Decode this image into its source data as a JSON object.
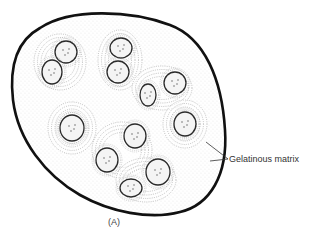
{
  "figure": {
    "caption": "(A)",
    "labels": [
      {
        "text": "Gelatinous matrix",
        "x": 229,
        "y": 156
      }
    ],
    "colony": {
      "outline_path": "M 40 28 C 70 8, 130 10, 170 25 C 205 38, 222 80, 225 130 C 228 175, 210 205, 180 212 C 150 220, 110 212, 80 195 C 45 175, 18 140, 13 100 C 9 65, 18 40, 40 28 Z",
      "stroke": "#111111"
    },
    "cells": [
      {
        "cx": 66,
        "cy": 52,
        "rx": 11,
        "ry": 11
      },
      {
        "cx": 52,
        "cy": 72,
        "rx": 10,
        "ry": 12
      },
      {
        "cx": 121,
        "cy": 48,
        "rx": 11,
        "ry": 10
      },
      {
        "cx": 118,
        "cy": 72,
        "rx": 11,
        "ry": 11
      },
      {
        "cx": 148,
        "cy": 95,
        "rx": 8,
        "ry": 11
      },
      {
        "cx": 175,
        "cy": 83,
        "rx": 11,
        "ry": 11
      },
      {
        "cx": 72,
        "cy": 128,
        "rx": 12,
        "ry": 13
      },
      {
        "cx": 185,
        "cy": 124,
        "rx": 11,
        "ry": 12
      },
      {
        "cx": 135,
        "cy": 136,
        "rx": 11,
        "ry": 12
      },
      {
        "cx": 107,
        "cy": 160,
        "rx": 11,
        "ry": 12
      },
      {
        "cx": 158,
        "cy": 172,
        "rx": 12,
        "ry": 13
      },
      {
        "cx": 131,
        "cy": 188,
        "rx": 11,
        "ry": 9
      }
    ],
    "sheath_groups": [
      {
        "cx": 60,
        "cy": 62,
        "rx": 26,
        "ry": 28
      },
      {
        "cx": 120,
        "cy": 60,
        "rx": 22,
        "ry": 30
      },
      {
        "cx": 162,
        "cy": 88,
        "rx": 30,
        "ry": 22
      },
      {
        "cx": 72,
        "cy": 128,
        "rx": 24,
        "ry": 26
      },
      {
        "cx": 185,
        "cy": 124,
        "rx": 22,
        "ry": 24
      },
      {
        "cx": 122,
        "cy": 150,
        "rx": 30,
        "ry": 28
      },
      {
        "cx": 146,
        "cy": 180,
        "rx": 30,
        "ry": 22
      }
    ]
  }
}
